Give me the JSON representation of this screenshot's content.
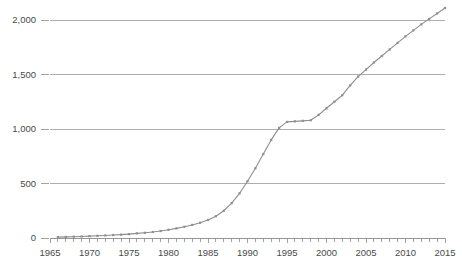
{
  "chart_data": {
    "type": "line",
    "title": "",
    "subtitle": "",
    "xlabel": "",
    "ylabel": "",
    "xlim": [
      1965,
      2015
    ],
    "ylim": [
      0,
      2200
    ],
    "grid": true,
    "legend": false,
    "legend_position": "none",
    "yticks": [
      0,
      500,
      1000,
      1500,
      2000
    ],
    "ytick_labels": [
      "0",
      "500",
      "1,000",
      "1,500",
      "2,000"
    ],
    "xticks": [
      1965,
      1970,
      1975,
      1980,
      1985,
      1990,
      1995,
      2000,
      2005,
      2010,
      2015
    ],
    "xtick_labels": [
      "1965",
      "1970",
      "1975",
      "1980",
      "1985",
      "1990",
      "1995",
      "2000",
      "2005",
      "2010",
      "2015"
    ],
    "minor_xtick_interval": 1,
    "marker": "square",
    "line_color": "#8e8e8e",
    "grid_color": "#9a9a9a",
    "text_color": "#4a4a4a",
    "background_color": "#ffffff",
    "x": [
      1966,
      1967,
      1968,
      1969,
      1970,
      1971,
      1972,
      1973,
      1974,
      1975,
      1976,
      1977,
      1978,
      1979,
      1980,
      1981,
      1982,
      1983,
      1984,
      1985,
      1986,
      1987,
      1988,
      1989,
      1990,
      1991,
      1992,
      1993,
      1994,
      1995,
      1996,
      1997,
      1998,
      1999,
      2000,
      2001,
      2002,
      2003,
      2004,
      2005,
      2006,
      2007,
      2008,
      2009,
      2010,
      2011,
      2012,
      2013,
      2014,
      2015
    ],
    "values": [
      8,
      10,
      12,
      14,
      17,
      20,
      23,
      27,
      31,
      36,
      42,
      48,
      55,
      64,
      75,
      88,
      103,
      120,
      140,
      165,
      200,
      250,
      320,
      410,
      520,
      640,
      770,
      900,
      1010,
      1065,
      1070,
      1075,
      1080,
      1130,
      1190,
      1250,
      1310,
      1400,
      1480,
      1545,
      1610,
      1670,
      1730,
      1790,
      1850,
      1905,
      1960,
      2010,
      2060,
      2110
    ],
    "series": [
      {
        "name": "series-1",
        "values": [
          8,
          10,
          12,
          14,
          17,
          20,
          23,
          27,
          31,
          36,
          42,
          48,
          55,
          64,
          75,
          88,
          103,
          120,
          140,
          165,
          200,
          250,
          320,
          410,
          520,
          640,
          770,
          900,
          1010,
          1065,
          1070,
          1075,
          1080,
          1130,
          1190,
          1250,
          1310,
          1400,
          1480,
          1545,
          1610,
          1670,
          1730,
          1790,
          1850,
          1905,
          1960,
          2010,
          2060,
          2110
        ]
      }
    ]
  },
  "plot_geometry": {
    "left": 50,
    "right": 445,
    "top": 20,
    "bottom": 238
  }
}
